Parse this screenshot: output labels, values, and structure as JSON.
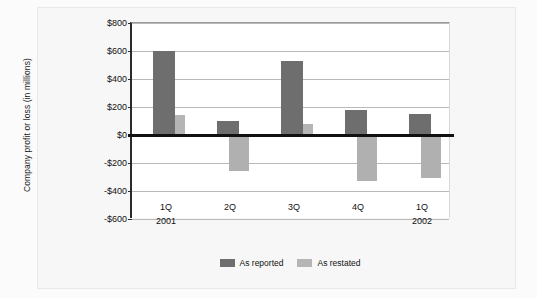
{
  "chart_data": {
    "type": "bar",
    "title": "",
    "xlabel": "",
    "ylabel": "Company profit or loss (in millions)",
    "categories": [
      "1Q",
      "2Q",
      "3Q",
      "4Q",
      "1Q"
    ],
    "period_years": [
      "2001",
      "",
      "",
      "",
      "2002"
    ],
    "ylim": [
      -600,
      800
    ],
    "ytick_labels": [
      "$800",
      "$600",
      "$400",
      "$200",
      "$0",
      "-$200",
      "-$400",
      "-$600"
    ],
    "ytick_values": [
      800,
      600,
      400,
      200,
      0,
      -200,
      -400,
      -600
    ],
    "grid": true,
    "legend_position": "bottom-center",
    "series": [
      {
        "name": "As reported",
        "color": "#6e6e6e",
        "values": [
          600,
          100,
          530,
          180,
          150
        ]
      },
      {
        "name": "As restated",
        "color": "#b5b5b5",
        "values": [
          140,
          -260,
          80,
          -330,
          -310
        ]
      }
    ],
    "annotations": []
  },
  "legend": {
    "items": [
      {
        "label": "As reported",
        "swatch": "rep"
      },
      {
        "label": "As restated",
        "swatch": "res"
      }
    ]
  }
}
